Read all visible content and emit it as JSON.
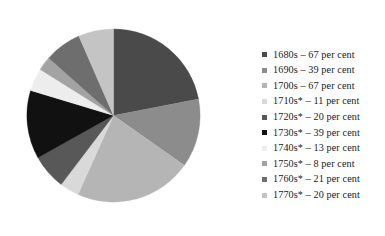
{
  "figure": {
    "type": "pie-chart-figure",
    "background": "#ffffff"
  },
  "chart_data": {
    "type": "pie",
    "title": "",
    "subtitle": "",
    "xlabel": "",
    "ylabel": "",
    "grid": false,
    "legend_position": "right",
    "value_unit": "per cent",
    "start_angle_deg": 0,
    "direction": "clockwise",
    "categories": [
      "1680s",
      "1690s",
      "1700s",
      "1710s*",
      "1720s*",
      "1730s*",
      "1740s*",
      "1750s*",
      "1760s*",
      "1770s*"
    ],
    "values": [
      67,
      39,
      67,
      11,
      20,
      39,
      13,
      8,
      21,
      20
    ],
    "total": 305,
    "colors": [
      "#4a4a4a",
      "#8c8c8c",
      "#b5b5b5",
      "#d9d9d9",
      "#585858",
      "#111111",
      "#ededed",
      "#a3a3a3",
      "#6e6e6e",
      "#c4c4c4"
    ],
    "slices": [
      {
        "label": "1680s",
        "value": 67,
        "unit": "per cent",
        "color": "#4a4a4a",
        "legend_text": "1680s – 67 per cent"
      },
      {
        "label": "1690s",
        "value": 39,
        "unit": "per cent",
        "color": "#8c8c8c",
        "legend_text": "1690s – 39 per cent"
      },
      {
        "label": "1700s",
        "value": 67,
        "unit": "per cent",
        "color": "#b5b5b5",
        "legend_text": "1700s – 67 per cent"
      },
      {
        "label": "1710s*",
        "value": 11,
        "unit": "per cent",
        "color": "#d9d9d9",
        "legend_text": "1710s* – 11 per cent"
      },
      {
        "label": "1720s*",
        "value": 20,
        "unit": "per cent",
        "color": "#585858",
        "legend_text": "1720s* – 20 per cent"
      },
      {
        "label": "1730s*",
        "value": 39,
        "unit": "per cent",
        "color": "#111111",
        "legend_text": "1730s* – 39 per cent"
      },
      {
        "label": "1740s*",
        "value": 13,
        "unit": "per cent",
        "color": "#ededed",
        "legend_text": "1740s* – 13 per cent"
      },
      {
        "label": "1750s*",
        "value": 8,
        "unit": "per cent",
        "color": "#a3a3a3",
        "legend_text": "1750s* – 8 per cent"
      },
      {
        "label": "1760s*",
        "value": 21,
        "unit": "per cent",
        "color": "#6e6e6e",
        "legend_text": "1760s* – 21 per cent"
      },
      {
        "label": "1770s*",
        "value": 20,
        "unit": "per cent",
        "color": "#c4c4c4",
        "legend_text": "1770s* – 20 per cent"
      }
    ]
  }
}
